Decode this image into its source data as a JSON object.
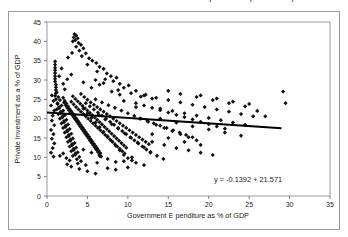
{
  "figure": {
    "title": "Private Investment and Government Expenditure (% of GDP)",
    "background_color": "#ffffff",
    "frame_color": "#9a9a9a"
  },
  "chart_data": {
    "type": "scatter",
    "title": "Private Investment and Government Expenditure (% of GDP)",
    "xlabel": "Government E penditure as % of GDP",
    "ylabel": "Private Investment as a % of GDP",
    "xlim": [
      0,
      35
    ],
    "ylim": [
      0,
      45
    ],
    "xticks": [
      0,
      5,
      10,
      15,
      20,
      25,
      30,
      35
    ],
    "yticks": [
      0,
      5,
      10,
      15,
      20,
      25,
      30,
      35,
      40,
      45
    ],
    "grid": false,
    "legend": null,
    "marker": "diamond",
    "marker_color": "#111111",
    "marker_size": 2.1,
    "annotation": "y = -0.1392  + 21.571",
    "annotation_position": "bottom-right-inside",
    "trendline": {
      "type": "linear",
      "slope": -0.1392,
      "intercept": 21.571,
      "x_start": 0.0,
      "x_end": 29.0,
      "color": "#000000",
      "width": 2
    },
    "points": [
      [
        1.0,
        34.8
      ],
      [
        1.0,
        34.0
      ],
      [
        1.0,
        33.2
      ],
      [
        1.0,
        32.5
      ],
      [
        1.0,
        31.8
      ],
      [
        1.0,
        31.0
      ],
      [
        1.0,
        30.3
      ],
      [
        1.0,
        29.6
      ],
      [
        1.1,
        28.8
      ],
      [
        1.1,
        28.1
      ],
      [
        1.1,
        27.4
      ],
      [
        1.1,
        26.6
      ],
      [
        1.0,
        25.9
      ],
      [
        3.4,
        41.9
      ],
      [
        3.6,
        41.5
      ],
      [
        3.3,
        41.0
      ],
      [
        3.8,
        40.8
      ],
      [
        3.5,
        40.3
      ],
      [
        3.2,
        40.0
      ],
      [
        3.9,
        39.6
      ],
      [
        4.2,
        39.1
      ],
      [
        3.6,
        38.6
      ],
      [
        4.5,
        38.2
      ],
      [
        4.0,
        37.6
      ],
      [
        4.8,
        36.9
      ],
      [
        4.3,
        36.2
      ],
      [
        5.2,
        35.6
      ],
      [
        5.6,
        35.0
      ],
      [
        6.1,
        34.4
      ],
      [
        5.0,
        34.0
      ],
      [
        6.5,
        33.4
      ],
      [
        7.0,
        32.9
      ],
      [
        6.2,
        32.2
      ],
      [
        7.4,
        31.7
      ],
      [
        7.9,
        31.0
      ],
      [
        8.6,
        30.6
      ],
      [
        7.2,
        30.2
      ],
      [
        8.2,
        29.7
      ],
      [
        9.0,
        29.0
      ],
      [
        10.1,
        28.6
      ],
      [
        9.5,
        28.0
      ],
      [
        8.8,
        27.4
      ],
      [
        11.0,
        27.2
      ],
      [
        10.4,
        26.6
      ],
      [
        12.2,
        26.2
      ],
      [
        11.6,
        25.7
      ],
      [
        13.0,
        25.2
      ],
      [
        0.6,
        26.0
      ],
      [
        0.8,
        24.6
      ],
      [
        0.5,
        23.4
      ],
      [
        0.9,
        22.1
      ],
      [
        0.7,
        20.8
      ],
      [
        0.6,
        19.5
      ],
      [
        0.9,
        18.3
      ],
      [
        0.5,
        17.1
      ],
      [
        0.8,
        16.0
      ],
      [
        0.6,
        14.8
      ],
      [
        0.9,
        13.6
      ],
      [
        0.7,
        12.4
      ],
      [
        0.5,
        11.2
      ],
      [
        0.8,
        10.2
      ],
      [
        1.2,
        26.8
      ],
      [
        1.4,
        25.6
      ],
      [
        1.6,
        24.8
      ],
      [
        1.3,
        24.0
      ],
      [
        1.8,
        23.4
      ],
      [
        1.5,
        22.7
      ],
      [
        2.0,
        22.1
      ],
      [
        1.7,
        21.5
      ],
      [
        2.2,
        20.9
      ],
      [
        1.9,
        20.3
      ],
      [
        2.4,
        19.7
      ],
      [
        2.1,
        19.1
      ],
      [
        2.6,
        18.5
      ],
      [
        2.3,
        17.9
      ],
      [
        2.8,
        17.3
      ],
      [
        2.5,
        16.7
      ],
      [
        3.0,
        16.1
      ],
      [
        2.7,
        15.5
      ],
      [
        3.2,
        14.9
      ],
      [
        2.9,
        14.3
      ],
      [
        3.4,
        13.7
      ],
      [
        3.1,
        13.1
      ],
      [
        3.6,
        12.5
      ],
      [
        3.3,
        11.9
      ],
      [
        3.8,
        11.3
      ],
      [
        3.5,
        10.7
      ],
      [
        4.0,
        10.1
      ],
      [
        3.7,
        9.5
      ],
      [
        4.2,
        9.0
      ],
      [
        1.1,
        25.0
      ],
      [
        1.3,
        23.8
      ],
      [
        1.5,
        23.0
      ],
      [
        1.2,
        22.4
      ],
      [
        1.7,
        21.8
      ],
      [
        1.4,
        21.2
      ],
      [
        1.9,
        20.6
      ],
      [
        1.6,
        20.0
      ],
      [
        2.1,
        19.4
      ],
      [
        1.8,
        18.8
      ],
      [
        2.3,
        18.2
      ],
      [
        2.0,
        17.6
      ],
      [
        2.5,
        17.0
      ],
      [
        2.2,
        16.4
      ],
      [
        2.7,
        15.8
      ],
      [
        2.4,
        15.2
      ],
      [
        2.9,
        14.6
      ],
      [
        2.6,
        14.0
      ],
      [
        3.1,
        13.4
      ],
      [
        2.8,
        12.8
      ],
      [
        3.3,
        12.2
      ],
      [
        3.0,
        11.6
      ],
      [
        3.5,
        11.0
      ],
      [
        3.2,
        10.4
      ],
      [
        2.0,
        25.4
      ],
      [
        2.2,
        24.6
      ],
      [
        2.4,
        23.9
      ],
      [
        2.6,
        23.2
      ],
      [
        2.8,
        22.5
      ],
      [
        3.0,
        21.9
      ],
      [
        3.2,
        21.3
      ],
      [
        3.4,
        20.7
      ],
      [
        3.6,
        20.1
      ],
      [
        3.8,
        19.5
      ],
      [
        4.0,
        18.9
      ],
      [
        4.2,
        18.3
      ],
      [
        4.4,
        17.7
      ],
      [
        4.6,
        17.1
      ],
      [
        4.8,
        16.5
      ],
      [
        5.0,
        15.9
      ],
      [
        5.2,
        15.3
      ],
      [
        5.4,
        14.7
      ],
      [
        5.6,
        14.1
      ],
      [
        5.8,
        13.5
      ],
      [
        6.0,
        12.9
      ],
      [
        6.2,
        12.3
      ],
      [
        6.4,
        11.7
      ],
      [
        6.6,
        11.1
      ],
      [
        2.1,
        24.2
      ],
      [
        2.3,
        23.5
      ],
      [
        2.5,
        22.8
      ],
      [
        2.7,
        22.2
      ],
      [
        2.9,
        21.6
      ],
      [
        3.1,
        21.0
      ],
      [
        3.3,
        20.4
      ],
      [
        3.5,
        19.8
      ],
      [
        3.7,
        19.2
      ],
      [
        3.9,
        18.6
      ],
      [
        4.1,
        18.0
      ],
      [
        4.3,
        17.4
      ],
      [
        4.5,
        16.8
      ],
      [
        4.7,
        16.2
      ],
      [
        4.9,
        15.6
      ],
      [
        5.1,
        15.0
      ],
      [
        5.3,
        14.4
      ],
      [
        5.5,
        13.8
      ],
      [
        5.7,
        13.2
      ],
      [
        5.9,
        12.6
      ],
      [
        6.1,
        12.0
      ],
      [
        6.3,
        11.4
      ],
      [
        6.5,
        10.8
      ],
      [
        6.7,
        10.2
      ],
      [
        3.0,
        24.4
      ],
      [
        3.3,
        23.7
      ],
      [
        3.6,
        23.0
      ],
      [
        3.9,
        22.4
      ],
      [
        4.2,
        21.8
      ],
      [
        4.5,
        21.2
      ],
      [
        4.8,
        20.6
      ],
      [
        5.1,
        20.0
      ],
      [
        5.4,
        19.4
      ],
      [
        5.7,
        18.8
      ],
      [
        6.0,
        18.2
      ],
      [
        6.3,
        17.6
      ],
      [
        6.6,
        17.0
      ],
      [
        6.9,
        16.4
      ],
      [
        7.2,
        15.8
      ],
      [
        7.5,
        15.2
      ],
      [
        7.8,
        14.6
      ],
      [
        8.1,
        14.0
      ],
      [
        8.4,
        13.4
      ],
      [
        8.7,
        12.8
      ],
      [
        9.0,
        12.2
      ],
      [
        9.3,
        11.6
      ],
      [
        9.6,
        11.0
      ],
      [
        3.2,
        25.8
      ],
      [
        3.5,
        25.1
      ],
      [
        3.8,
        24.5
      ],
      [
        4.1,
        23.9
      ],
      [
        4.4,
        23.3
      ],
      [
        4.7,
        22.7
      ],
      [
        5.0,
        22.1
      ],
      [
        5.3,
        21.5
      ],
      [
        5.6,
        20.9
      ],
      [
        5.9,
        20.3
      ],
      [
        6.2,
        19.7
      ],
      [
        6.5,
        19.1
      ],
      [
        6.8,
        18.5
      ],
      [
        7.1,
        17.9
      ],
      [
        7.4,
        17.3
      ],
      [
        7.7,
        16.7
      ],
      [
        8.0,
        16.1
      ],
      [
        8.3,
        15.5
      ],
      [
        8.6,
        14.9
      ],
      [
        8.9,
        14.3
      ],
      [
        9.2,
        13.7
      ],
      [
        9.5,
        13.1
      ],
      [
        9.8,
        12.5
      ],
      [
        4.2,
        26.4
      ],
      [
        4.6,
        25.6
      ],
      [
        5.0,
        24.9
      ],
      [
        5.4,
        24.2
      ],
      [
        5.8,
        23.6
      ],
      [
        6.2,
        23.0
      ],
      [
        6.6,
        22.4
      ],
      [
        7.0,
        21.8
      ],
      [
        7.4,
        21.2
      ],
      [
        7.8,
        20.6
      ],
      [
        8.2,
        20.0
      ],
      [
        8.6,
        19.4
      ],
      [
        9.0,
        18.8
      ],
      [
        9.4,
        18.2
      ],
      [
        9.8,
        17.6
      ],
      [
        10.2,
        17.0
      ],
      [
        10.6,
        16.4
      ],
      [
        11.0,
        15.8
      ],
      [
        11.4,
        15.2
      ],
      [
        11.8,
        14.6
      ],
      [
        12.2,
        14.0
      ],
      [
        12.6,
        13.4
      ],
      [
        4.5,
        22.6
      ],
      [
        5.0,
        21.4
      ],
      [
        5.5,
        20.2
      ],
      [
        6.0,
        19.0
      ],
      [
        6.5,
        17.8
      ],
      [
        7.0,
        16.6
      ],
      [
        7.5,
        15.4
      ],
      [
        8.0,
        14.2
      ],
      [
        8.5,
        13.0
      ],
      [
        9.0,
        11.8
      ],
      [
        9.5,
        10.6
      ],
      [
        10.0,
        9.8
      ],
      [
        10.5,
        9.2
      ],
      [
        11.0,
        8.6
      ],
      [
        4.8,
        24.0
      ],
      [
        5.3,
        23.2
      ],
      [
        5.8,
        22.4
      ],
      [
        6.3,
        21.6
      ],
      [
        6.8,
        20.8
      ],
      [
        7.3,
        20.0
      ],
      [
        7.8,
        19.2
      ],
      [
        8.3,
        18.4
      ],
      [
        8.8,
        17.6
      ],
      [
        9.3,
        16.8
      ],
      [
        9.8,
        16.0
      ],
      [
        10.3,
        15.2
      ],
      [
        10.8,
        14.4
      ],
      [
        11.3,
        13.6
      ],
      [
        11.8,
        12.8
      ],
      [
        12.3,
        12.0
      ],
      [
        12.8,
        11.2
      ],
      [
        6.0,
        25.0
      ],
      [
        6.8,
        24.2
      ],
      [
        7.6,
        23.5
      ],
      [
        8.4,
        22.8
      ],
      [
        9.2,
        22.1
      ],
      [
        10.0,
        21.4
      ],
      [
        10.8,
        20.7
      ],
      [
        11.6,
        20.0
      ],
      [
        12.4,
        19.4
      ],
      [
        13.2,
        18.8
      ],
      [
        14.0,
        18.2
      ],
      [
        14.8,
        17.6
      ],
      [
        15.6,
        17.0
      ],
      [
        16.4,
        16.4
      ],
      [
        17.2,
        15.8
      ],
      [
        18.0,
        15.2
      ],
      [
        6.4,
        21.0
      ],
      [
        7.2,
        19.8
      ],
      [
        8.0,
        18.6
      ],
      [
        8.8,
        17.4
      ],
      [
        9.6,
        16.2
      ],
      [
        10.4,
        15.0
      ],
      [
        11.2,
        13.8
      ],
      [
        12.0,
        12.6
      ],
      [
        12.8,
        11.4
      ],
      [
        13.6,
        10.4
      ],
      [
        14.4,
        9.6
      ],
      [
        11.0,
        24.0
      ],
      [
        12.0,
        23.4
      ],
      [
        13.0,
        22.8
      ],
      [
        14.0,
        22.2
      ],
      [
        15.0,
        21.6
      ],
      [
        16.0,
        21.0
      ],
      [
        17.0,
        20.4
      ],
      [
        18.0,
        19.8
      ],
      [
        19.0,
        19.2
      ],
      [
        20.0,
        18.6
      ],
      [
        21.0,
        18.0
      ],
      [
        22.0,
        17.4
      ],
      [
        11.5,
        20.0
      ],
      [
        12.5,
        19.2
      ],
      [
        13.5,
        18.4
      ],
      [
        14.5,
        17.6
      ],
      [
        15.5,
        16.8
      ],
      [
        16.5,
        16.0
      ],
      [
        17.5,
        15.2
      ],
      [
        18.5,
        14.4
      ],
      [
        12.0,
        26.0
      ],
      [
        13.5,
        25.4
      ],
      [
        15.0,
        24.8
      ],
      [
        16.5,
        24.2
      ],
      [
        18.0,
        23.6
      ],
      [
        19.5,
        23.0
      ],
      [
        21.0,
        22.4
      ],
      [
        22.5,
        21.8
      ],
      [
        24.0,
        21.2
      ],
      [
        25.5,
        20.6
      ],
      [
        13.0,
        14.0
      ],
      [
        14.5,
        13.2
      ],
      [
        16.0,
        12.4
      ],
      [
        17.5,
        11.8
      ],
      [
        19.0,
        11.2
      ],
      [
        20.5,
        10.6
      ],
      [
        14.0,
        22.6
      ],
      [
        15.5,
        22.0
      ],
      [
        17.0,
        21.4
      ],
      [
        18.5,
        20.8
      ],
      [
        20.0,
        20.2
      ],
      [
        21.5,
        19.6
      ],
      [
        23.0,
        19.0
      ],
      [
        24.5,
        18.4
      ],
      [
        15.0,
        27.2
      ],
      [
        16.5,
        26.4
      ],
      [
        18.5,
        25.6
      ],
      [
        20.5,
        24.8
      ],
      [
        22.5,
        24.0
      ],
      [
        24.5,
        23.2
      ],
      [
        19.0,
        26.0
      ],
      [
        21.0,
        25.2
      ],
      [
        23.0,
        24.4
      ],
      [
        25.0,
        23.8
      ],
      [
        26.0,
        22.0
      ],
      [
        27.0,
        20.6
      ],
      [
        29.2,
        27.0
      ],
      [
        29.5,
        24.0
      ],
      [
        4.0,
        7.0
      ],
      [
        5.0,
        6.4
      ],
      [
        6.0,
        5.8
      ],
      [
        3.0,
        7.6
      ],
      [
        2.5,
        8.2
      ],
      [
        7.5,
        7.2
      ],
      [
        8.5,
        6.8
      ],
      [
        10.0,
        7.4
      ],
      [
        12.0,
        8.0
      ],
      [
        5.5,
        28.0
      ],
      [
        6.5,
        28.8
      ],
      [
        4.5,
        29.4
      ],
      [
        8.0,
        27.0
      ],
      [
        9.0,
        26.2
      ],
      [
        2.0,
        29.0
      ],
      [
        2.5,
        30.2
      ],
      [
        3.0,
        31.4
      ],
      [
        2.2,
        27.6
      ],
      [
        1.5,
        31.0
      ],
      [
        1.8,
        33.0
      ],
      [
        2.6,
        35.8
      ],
      [
        3.1,
        37.0
      ],
      [
        6.0,
        30.0
      ],
      [
        7.0,
        29.2
      ],
      [
        9.5,
        24.6
      ],
      [
        11.0,
        23.0
      ],
      [
        14.0,
        20.0
      ],
      [
        16.0,
        19.0
      ],
      [
        18.0,
        18.0
      ],
      [
        20.0,
        17.2
      ],
      [
        22.0,
        16.4
      ],
      [
        24.0,
        15.6
      ],
      [
        4.5,
        12.0
      ],
      [
        5.5,
        11.2
      ],
      [
        6.5,
        10.4
      ],
      [
        7.5,
        9.6
      ],
      [
        8.5,
        8.8
      ],
      [
        3.8,
        8.4
      ],
      [
        4.8,
        8.0
      ],
      [
        6.2,
        8.6
      ],
      [
        9.5,
        9.0
      ],
      [
        10.5,
        10.0
      ],
      [
        2.0,
        11.0
      ],
      [
        2.4,
        9.8
      ],
      [
        1.6,
        10.4
      ],
      [
        2.8,
        9.2
      ],
      [
        13.0,
        16.0
      ],
      [
        15.0,
        15.0
      ],
      [
        17.0,
        14.0
      ],
      [
        19.0,
        13.2
      ]
    ]
  },
  "axes": {
    "y_tick_labels": [
      "0",
      "5",
      "10",
      "15",
      "20",
      "25",
      "30",
      "35",
      "40",
      "45"
    ],
    "x_tick_labels": [
      "0",
      "5",
      "10",
      "15",
      "20",
      "25",
      "30",
      "35"
    ]
  }
}
